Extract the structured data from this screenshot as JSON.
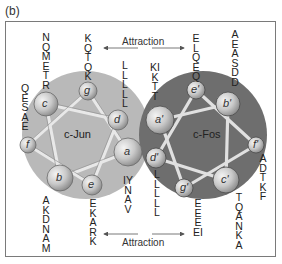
{
  "panel_label": "(b)",
  "helices": {
    "left": {
      "name": "c-Jun",
      "color": "#b9b9b9"
    },
    "right": {
      "name": "c-Fos",
      "color": "#6e6e6e"
    }
  },
  "attraction_top": "Attraction",
  "attraction_bottom": "Attraction",
  "nodes_left": [
    {
      "id": "a",
      "label": "a"
    },
    {
      "id": "b",
      "label": "b"
    },
    {
      "id": "c",
      "label": "c"
    },
    {
      "id": "d",
      "label": "d"
    },
    {
      "id": "e",
      "label": "e"
    },
    {
      "id": "f",
      "label": "f"
    },
    {
      "id": "g",
      "label": "g"
    }
  ],
  "nodes_right": [
    {
      "id": "a_prime",
      "label": "a'"
    },
    {
      "id": "b_prime",
      "label": "b'"
    },
    {
      "id": "c_prime",
      "label": "c'"
    },
    {
      "id": "d_prime",
      "label": "d'"
    },
    {
      "id": "e_prime",
      "label": "e'"
    },
    {
      "id": "f_prime",
      "label": "f'"
    },
    {
      "id": "g_prime",
      "label": "g'"
    }
  ],
  "sequences": {
    "c": "NQMETR",
    "g": "KQTQK",
    "d": "LLLLL",
    "f": "QESAE",
    "b": "AKDNAM",
    "e": "EKARK",
    "a": "IYNAV",
    "a_prime": "KIKTT",
    "e_prime": "ELQEQ",
    "b_prime": "AEASDD",
    "f_prime": "ADTKF",
    "d_prime": "LLLLL",
    "g_prime": "EEEEI",
    "c_prime": "TQANKA"
  }
}
